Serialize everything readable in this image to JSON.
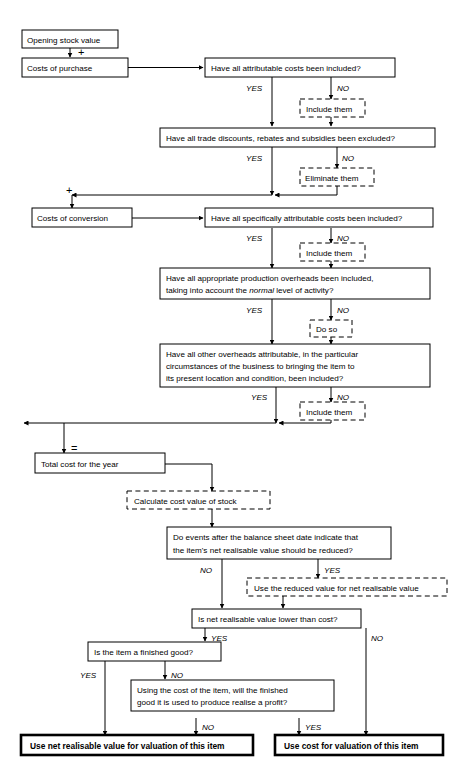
{
  "diagram": {
    "nodes": {
      "opening_stock": "Opening stock value",
      "costs_purchase": "Costs of purchase",
      "q_attributable": "Have all attributable costs been included?",
      "a_include_them_1": "Include them",
      "q_trade_discounts": "Have all trade discounts, rebates and subsidies been excluded?",
      "a_eliminate_them": "Eliminate them",
      "costs_conversion": "Costs of conversion",
      "q_specifically_attributable": "Have all specifically attributable costs been included?",
      "a_include_them_2": "Include them",
      "q_production_overheads_line1": "Have all appropriate production overheads been included,",
      "q_production_overheads_line2_a": "taking into account the ",
      "q_production_overheads_line2_ital": "normal",
      "q_production_overheads_line2_b": " level of activity?",
      "a_do_so": "Do so",
      "q_other_overheads_line1": "Have all other overheads attributable, in the particular",
      "q_other_overheads_line2": "circumstances of the business to bringing the item to",
      "q_other_overheads_line3": "its present location and condition, been included?",
      "a_include_them_3": "Include them",
      "total_cost": "Total cost for the year",
      "a_calculate_cost_value": "Calculate cost value of stock",
      "q_events_line1": "Do events after the balance sheet date indicate that",
      "q_events_line2": "the item's net realisable value should be reduced?",
      "a_use_reduced_value": "Use the reduced value for net realisable value",
      "q_nrv_lower": "Is net realisable value lower than cost?",
      "q_finished_good": "Is the item a finished good?",
      "q_profit_line1": "Using the cost of the item, will the finished",
      "q_profit_line2": "good it is used to produce realise a profit?",
      "result_nrv": "Use net realisable value for valuation of this item",
      "result_cost": "Use cost for valuation of this item"
    },
    "edge_labels": {
      "yes": "YES",
      "no": "NO"
    },
    "operators": {
      "plus_1": "+",
      "plus_2": "+",
      "equals": "="
    },
    "colors": {
      "line": "#000000",
      "fill": "#ffffff",
      "text": "#000000"
    }
  }
}
